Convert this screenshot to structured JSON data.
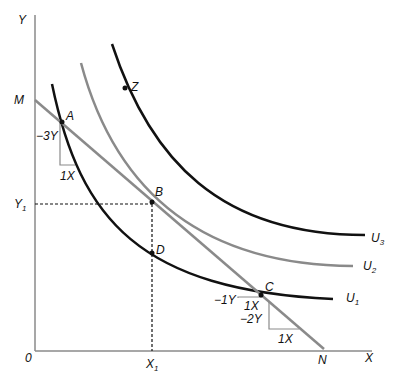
{
  "axes": {
    "y_label": "Y",
    "x_label": "X",
    "origin_label": "0"
  },
  "budget_line": {
    "start_label": "M",
    "end_label": "N",
    "color": "#8a8a8a"
  },
  "points": {
    "A": "A",
    "B": "B",
    "C": "C",
    "D": "D",
    "Z": "Z"
  },
  "markers": {
    "y1": "Y",
    "y1_sub": "1",
    "x1": "X",
    "x1_sub": "1"
  },
  "curves": {
    "u1": {
      "label": "U",
      "sub": "1",
      "color": "#111111"
    },
    "u2": {
      "label": "U",
      "sub": "2",
      "color": "#8a8a8a"
    },
    "u3": {
      "label": "U",
      "sub": "3",
      "color": "#111111"
    }
  },
  "slopes": {
    "a_rise": "−3Y",
    "a_run": "1X",
    "c_left_rise": "−1Y",
    "c_left_run": "1X",
    "c_rise": "−2Y",
    "c_run": "1X"
  }
}
